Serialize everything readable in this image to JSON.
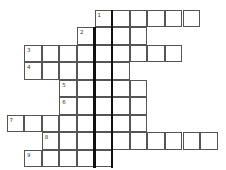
{
  "puzzle": {
    "type": "crossword",
    "highlight_column_note": "two thick vertical lines mark the hidden word column",
    "rows": [
      {
        "row": 0,
        "start_col": 5,
        "length": 6,
        "number": "1"
      },
      {
        "row": 1,
        "start_col": 4,
        "length": 4,
        "number": "2"
      },
      {
        "row": 2,
        "start_col": 1,
        "length": 9,
        "number": "3"
      },
      {
        "row": 3,
        "start_col": 1,
        "length": 6,
        "number": "4"
      },
      {
        "row": 4,
        "start_col": 3,
        "length": 5,
        "number": "5"
      },
      {
        "row": 5,
        "start_col": 3,
        "length": 5,
        "number": "6"
      },
      {
        "row": 6,
        "start_col": 0,
        "length": 8,
        "number": "7"
      },
      {
        "row": 7,
        "start_col": 2,
        "length": 10,
        "number": "8"
      },
      {
        "row": 8,
        "start_col": 1,
        "length": 5,
        "number": "9"
      }
    ],
    "highlight_column": 5
  }
}
